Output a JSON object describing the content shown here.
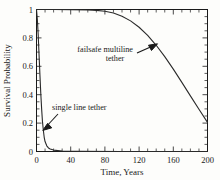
{
  "chart_data": {
    "type": "line",
    "title": "",
    "xlabel": "Time, Years",
    "ylabel": "Survival Probability",
    "xlim": [
      0,
      200
    ],
    "ylim": [
      0,
      1
    ],
    "grid": false,
    "legend_position": "none",
    "xticks": [
      0,
      40,
      80,
      120,
      160,
      200
    ],
    "xtick_labels": [
      "0",
      "40",
      "80",
      "120",
      "160",
      "200"
    ],
    "x_minor_interval": 10,
    "yticks": [
      0,
      0.2,
      0.4,
      0.6,
      0.8,
      1
    ],
    "ytick_labels": [
      "0",
      "0.2",
      "0.4",
      "0.6",
      "0.8",
      "1"
    ],
    "y_minor_interval": 0.05,
    "series": [
      {
        "name": "single line tether",
        "x": [
          0,
          1,
          2,
          3,
          4,
          5,
          6,
          7,
          8,
          9,
          10,
          12,
          14,
          16,
          20,
          30,
          50,
          100,
          150,
          200
        ],
        "values": [
          1.0,
          0.93,
          0.82,
          0.68,
          0.54,
          0.41,
          0.3,
          0.21,
          0.15,
          0.1,
          0.07,
          0.04,
          0.025,
          0.018,
          0.01,
          0.004,
          0.001,
          0.0,
          0.0,
          0.0
        ]
      },
      {
        "name": "failsafe multiline tether",
        "x": [
          0,
          20,
          40,
          60,
          70,
          80,
          90,
          100,
          110,
          120,
          130,
          140,
          150,
          160,
          170,
          180,
          190,
          200
        ],
        "values": [
          1.0,
          1.0,
          0.999,
          0.997,
          0.994,
          0.988,
          0.975,
          0.953,
          0.92,
          0.875,
          0.818,
          0.748,
          0.668,
          0.58,
          0.487,
          0.392,
          0.297,
          0.205
        ]
      }
    ],
    "annotations": [
      {
        "text_line1": "failsafe multiline",
        "text_line2": "tether",
        "points_to": "multiline-curve"
      },
      {
        "text_line1": "single line tether",
        "text_line2": "",
        "points_to": "single-line-curve"
      }
    ]
  },
  "axes": {
    "x_title": "Time, Years",
    "y_title": "Survival Probability"
  },
  "colors": {
    "curve": "#2a2a2a",
    "axis": "#1a1a1a",
    "background": "#fdfdfb"
  }
}
